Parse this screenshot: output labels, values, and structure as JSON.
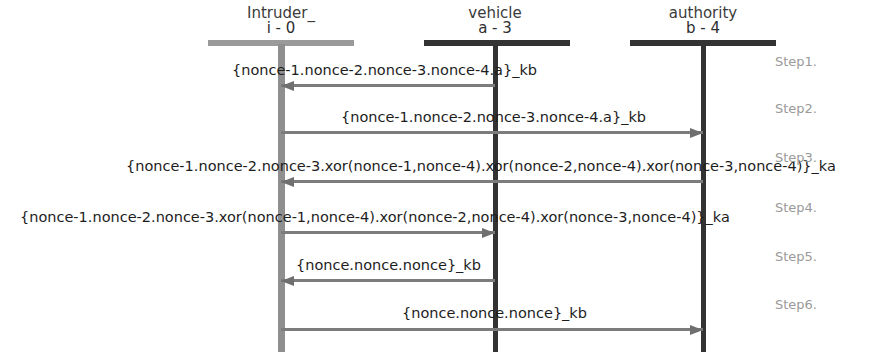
{
  "diagram": {
    "background": "#ffffff",
    "colors": {
      "intruder_lifeline": "#8f8f8f",
      "actor_lifeline": "#333333",
      "arrow": "#7c7c7c",
      "label_text": "#1d1d1d",
      "step_text": "#9a9a9a"
    }
  },
  "actors": [
    {
      "name": "Intruder_",
      "id": "i - 0",
      "center_x": 281,
      "bar_left": 208,
      "bar_width": 146,
      "bar_color": "#9a9a9a",
      "lifeline_color": "#8f8f8f",
      "lifeline_width": 7
    },
    {
      "name": "vehicle",
      "id": "a - 3",
      "center_x": 495,
      "bar_left": 424,
      "bar_width": 146,
      "bar_color": "#333333",
      "lifeline_color": "#333333",
      "lifeline_width": 5
    },
    {
      "name": "authority",
      "id": "b - 4",
      "center_x": 703,
      "bar_left": 630,
      "bar_width": 146,
      "bar_color": "#333333",
      "lifeline_color": "#333333",
      "lifeline_width": 5
    }
  ],
  "messages": [
    {
      "step": "Step1.",
      "label": "{nonce-1.nonce-2.nonce-3.nonce-4.a}_kb",
      "from_x": 495,
      "to_x": 281,
      "direction": "left",
      "y": 84,
      "label_left": 232,
      "label_y": 62,
      "step_y": 54
    },
    {
      "step": "Step2.",
      "label": "{nonce-1.nonce-2.nonce-3.nonce-4.a}_kb",
      "from_x": 281,
      "to_x": 703,
      "direction": "right",
      "y": 131,
      "label_left": 341,
      "label_y": 109,
      "step_y": 101
    },
    {
      "step": "Step3.",
      "label": "{nonce-1.nonce-2.nonce-3.xor(nonce-1,nonce-4).xor(nonce-2,nonce-4).xor(nonce-3,nonce-4)}_ka",
      "from_x": 703,
      "to_x": 281,
      "direction": "left",
      "y": 180,
      "label_left": 126,
      "label_y": 158,
      "step_y": 150
    },
    {
      "step": "Step4.",
      "label": "{nonce-1.nonce-2.nonce-3.xor(nonce-1,nonce-4).xor(nonce-2,nonce-4).xor(nonce-3,nonce-4)}_ka",
      "from_x": 281,
      "to_x": 495,
      "direction": "right",
      "y": 231,
      "label_left": 20,
      "label_y": 209,
      "step_y": 200
    },
    {
      "step": "Step5.",
      "label": "{nonce.nonce.nonce}_kb",
      "from_x": 495,
      "to_x": 281,
      "direction": "left",
      "y": 279,
      "label_left": 296,
      "label_y": 257,
      "step_y": 249
    },
    {
      "step": "Step6.",
      "label": "{nonce.nonce.nonce}_kb",
      "from_x": 281,
      "to_x": 703,
      "direction": "right",
      "y": 328,
      "label_left": 402,
      "label_y": 305,
      "step_y": 297
    }
  ],
  "step_label_x": 775,
  "lifeline_top": 44,
  "lifeline_bottom": 352
}
